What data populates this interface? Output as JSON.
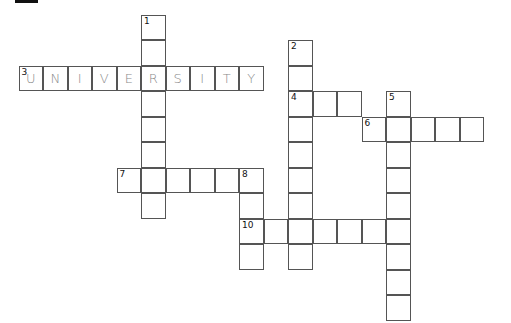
{
  "puzzle": {
    "cell_w": 24.5,
    "cell_h": 25.5,
    "origin_x": 19,
    "origin_y": 15,
    "words": [
      {
        "number": "1",
        "direction": "down",
        "row": 0,
        "col": 5,
        "length": 8,
        "answer": ""
      },
      {
        "number": "2",
        "direction": "down",
        "row": 1,
        "col": 11,
        "length": 9,
        "answer": ""
      },
      {
        "number": "3",
        "direction": "across",
        "row": 2,
        "col": 0,
        "length": 10,
        "answer": "UNIVERSITY"
      },
      {
        "number": "4",
        "direction": "across",
        "row": 3,
        "col": 11,
        "length": 3,
        "answer": ""
      },
      {
        "number": "5",
        "direction": "down",
        "row": 3,
        "col": 15,
        "length": 9,
        "answer": ""
      },
      {
        "number": "6",
        "direction": "across",
        "row": 4,
        "col": 14,
        "length": 5,
        "answer": ""
      },
      {
        "number": "7",
        "direction": "across",
        "row": 6,
        "col": 4,
        "length": 6,
        "answer": ""
      },
      {
        "number": "8",
        "direction": "down",
        "row": 6,
        "col": 9,
        "length": 4,
        "answer": ""
      },
      {
        "number": "10",
        "direction": "across",
        "row": 8,
        "col": 9,
        "length": 7,
        "answer": ""
      }
    ]
  }
}
